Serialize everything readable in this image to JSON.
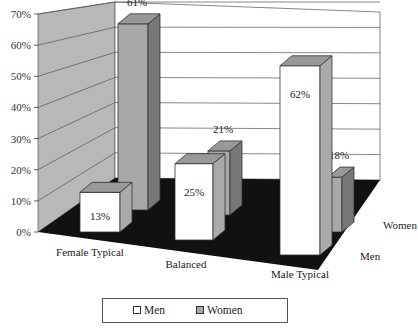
{
  "chart_data": {
    "type": "bar",
    "style": "3d-clustered-column",
    "title": "",
    "categories": [
      "Female Typical",
      "Balanced",
      "Male Typical"
    ],
    "series": [
      {
        "name": "Men",
        "values": [
          13,
          25,
          62
        ],
        "labels": [
          "13%",
          "25%",
          "62%"
        ],
        "color": "#ffffff"
      },
      {
        "name": "Women",
        "values": [
          61,
          21,
          18
        ],
        "labels": [
          "61%",
          "21%",
          "18%"
        ],
        "color": "#a8a8a8"
      }
    ],
    "depth_labels": [
      "Men",
      "Women"
    ],
    "yticks": [
      "0%",
      "10%",
      "20%",
      "30%",
      "40%",
      "50%",
      "60%",
      "70%"
    ],
    "ylim": [
      0,
      70
    ],
    "xlabel": "",
    "ylabel": "",
    "grid": true,
    "legend_position": "bottom",
    "colors": {
      "floor": "#111111",
      "side_wall": "#b8b8b8",
      "back_wall": "#ffffff"
    }
  },
  "legend": {
    "items": [
      "Men",
      "Women"
    ]
  }
}
